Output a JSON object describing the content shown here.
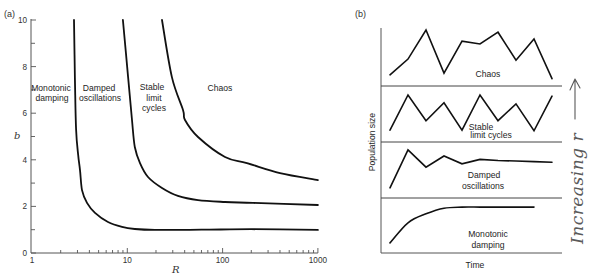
{
  "chart_data": [
    {
      "panel": "(a)",
      "type": "line",
      "title": "",
      "xlabel": "R",
      "ylabel": "b",
      "xscale": "log",
      "xlim": [
        1,
        1000
      ],
      "ylim": [
        0,
        10
      ],
      "grid": false,
      "legend": "none",
      "xticks": [
        {
          "value": 1,
          "label": "1"
        },
        {
          "value": 10,
          "label": "10"
        },
        {
          "value": 100,
          "label": "100"
        },
        {
          "value": 1000,
          "label": "1000"
        }
      ],
      "yticks": [
        {
          "value": 0,
          "label": "0"
        },
        {
          "value": 2,
          "label": "2"
        },
        {
          "value": 4,
          "label": "4"
        },
        {
          "value": 6,
          "label": "6"
        },
        {
          "value": 8,
          "label": "8"
        },
        {
          "value": 10,
          "label": "10"
        }
      ],
      "series": [
        {
          "boundary_between": [
            "Monotonic damping",
            "Damped oscillations"
          ],
          "points": [
            [
              2.76,
              10
            ],
            [
              2.82,
              7.5
            ],
            [
              2.9,
              5.3
            ],
            [
              3.05,
              4.2
            ],
            [
              3.19,
              3.56
            ],
            [
              3.35,
              2.7
            ],
            [
              3.78,
              2.15
            ],
            [
              4.58,
              1.72
            ],
            [
              6.27,
              1.33
            ],
            [
              8.8,
              1.12
            ],
            [
              12.0,
              1.03
            ],
            [
              19.5,
              0.99
            ],
            [
              60,
              1.0
            ],
            [
              200,
              1.02
            ],
            [
              1000,
              0.99
            ]
          ]
        },
        {
          "boundary_between": [
            "Damped oscillations",
            "Stable limit cycles"
          ],
          "points": [
            [
              9.0,
              10
            ],
            [
              10.2,
              7.55
            ],
            [
              11.2,
              5.71
            ],
            [
              12.0,
              4.55
            ],
            [
              13.6,
              3.86
            ],
            [
              16.5,
              3.26
            ],
            [
              23.1,
              2.79
            ],
            [
              34.0,
              2.45
            ],
            [
              55.2,
              2.27
            ],
            [
              106,
              2.19
            ],
            [
              209,
              2.15
            ],
            [
              1000,
              2.06
            ]
          ]
        },
        {
          "boundary_between": [
            "Stable limit cycles",
            "Chaos"
          ],
          "points": [
            [
              23.1,
              10
            ],
            [
              29.4,
              7.55
            ],
            [
              38.4,
              6.14
            ],
            [
              40.3,
              5.71
            ],
            [
              55.2,
              4.98
            ],
            [
              106,
              4.12
            ],
            [
              180,
              3.86
            ],
            [
              400,
              3.43
            ],
            [
              1000,
              3.13
            ]
          ]
        }
      ],
      "region_labels": [
        {
          "lines": [
            "Monotonic",
            "damping"
          ]
        },
        {
          "lines": [
            "Damped",
            "oscillations"
          ]
        },
        {
          "lines": [
            "Stable",
            "limit",
            "cycles"
          ]
        },
        {
          "lines": [
            "Chaos"
          ]
        }
      ]
    },
    {
      "panel": "(b)",
      "type": "line",
      "title": "",
      "xlabel": "Time",
      "ylabel": "Population size",
      "y_units": "relative (0–1 within each strip)",
      "annotation": "Increasing r",
      "annotation_arrow": "up",
      "series": [
        {
          "name": "Chaos",
          "label_lines": [
            "Chaos"
          ],
          "values": [
            0.2,
            0.48,
            1.0,
            0.23,
            0.8,
            0.75,
            0.96,
            0.46,
            0.84,
            0.13
          ]
        },
        {
          "name": "Stable limit cycles",
          "label_lines": [
            "Stable",
            "limit cycles"
          ],
          "values": [
            0.21,
            0.84,
            0.38,
            0.7,
            0.21,
            0.84,
            0.38,
            0.68,
            0.2,
            0.82
          ]
        },
        {
          "name": "Damped oscillations",
          "label_lines": [
            "Damped",
            "oscillations"
          ],
          "values": [
            0.18,
            0.86,
            0.55,
            0.75,
            0.61,
            0.69,
            0.67,
            0.66,
            0.65,
            0.64
          ]
        },
        {
          "name": "Monotonic damping",
          "label_lines": [
            "Monotonic",
            "damping"
          ],
          "values": [
            0.18,
            0.54,
            0.7,
            0.8,
            0.82,
            0.82,
            0.82,
            0.82,
            0.82
          ]
        }
      ]
    }
  ]
}
